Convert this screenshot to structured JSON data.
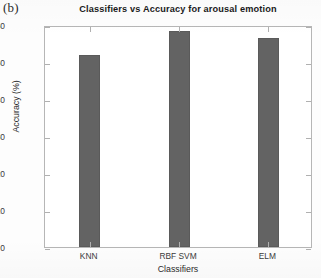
{
  "panel_label": "(b)",
  "chart_data": {
    "type": "bar",
    "title": "Classifiers vs Accuracy for arousal emotion",
    "xlabel": "Classifiers",
    "ylabel": "Accuracy (%)",
    "categories": [
      "KNN",
      "RBF SVM",
      "ELM"
    ],
    "values": [
      52,
      58.5,
      56.5
    ],
    "ylim": [
      0,
      60
    ],
    "yticks": [
      0,
      10,
      20,
      30,
      40,
      50,
      60
    ],
    "ytick_labels": [
      "0",
      "10",
      "20",
      "30",
      "40",
      "50",
      "60"
    ],
    "grid": false,
    "legend": null,
    "bar_color": "#636363",
    "axis_color": "#b6b6b6",
    "background_color": "#ffffff"
  }
}
